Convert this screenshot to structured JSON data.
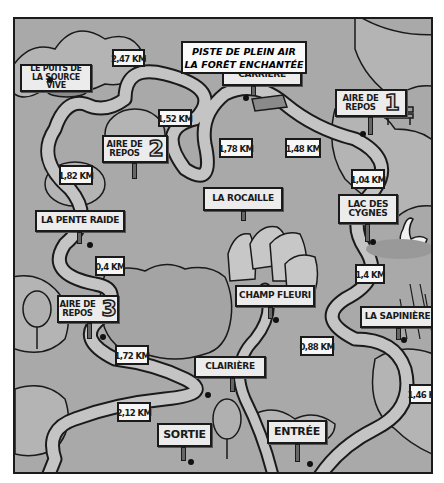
{
  "map": {
    "title_line1": "PISTE DE PLEIN AIR",
    "title_line2": "LA FORÊT ENCHANTÉE",
    "colors": {
      "background": "#a9a9a9",
      "trail": "#c4c4c4",
      "outline": "#1a1a1a",
      "sign": "#ececec"
    },
    "places": {
      "puits_line1": "LE PUITS DE",
      "puits_line2": "LA SOURCE VIVE",
      "carriere_line1": "LA VIEILLE",
      "carriere_line2": "CARRIÈRE",
      "repos1_line1": "AIRE DE",
      "repos1_line2": "REPOS",
      "repos1_num": "1",
      "repos2_line1": "AIRE DE",
      "repos2_line2": "REPOS",
      "repos2_num": "2",
      "repos3_line1": "AIRE DE",
      "repos3_line2": "REPOS",
      "repos3_num": "3",
      "rocaille": "LA ROCAILLE",
      "lac_line1": "LAC DES",
      "lac_line2": "CYGNES",
      "pente": "LA PENTE RAIDE",
      "champ": "CHAMP FLEURI",
      "sapiniere": "LA SAPINIÈRE",
      "clairiere": "CLAIRIÈRE",
      "sortie": "SORTIE",
      "entree": "ENTRÉE"
    },
    "distances": {
      "d1": "2,47 KM",
      "d2": "1,52 KM",
      "d3": "1,78 KM",
      "d4": "1,48 KM",
      "d5": "1,04 KM",
      "d6": "1,82 KM",
      "d7": "0,4 KM",
      "d8": "1,4 KM",
      "d9": "0,88 KM",
      "d10": "1,72 KM",
      "d11": "2,12 KM",
      "d12": "1,46 KM"
    }
  }
}
